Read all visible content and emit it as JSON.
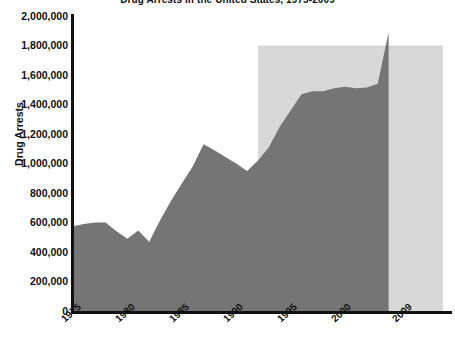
{
  "chart_data": {
    "type": "area",
    "title": "Drug Arrests in the United States, 1975-2009",
    "xlabel": "",
    "ylabel": "Drug Arrests",
    "ylim": [
      0,
      2000000
    ],
    "xlim": [
      1975,
      2009
    ],
    "grid": false,
    "legend": "none",
    "y_ticks": [
      "0",
      "200,000",
      "400,000",
      "600,000",
      "800,000",
      "1,000,000",
      "1,200,000",
      "1,400,000",
      "1,600,000",
      "1,800,000",
      "2,000,000"
    ],
    "y_tick_values": [
      0,
      200000,
      400000,
      600000,
      800000,
      1000000,
      1200000,
      1400000,
      1600000,
      1800000,
      2000000
    ],
    "x_ticks": [
      "1975",
      "1980",
      "1985",
      "1990",
      "1995",
      "2000",
      "2009"
    ],
    "x_tick_values": [
      1975,
      1980,
      1985,
      1990,
      1995,
      2000,
      2009
    ],
    "series": [
      {
        "name": "Drug Arrests",
        "color": "#757575",
        "x": [
          1975,
          1976,
          1977,
          1978,
          1979,
          1980,
          1981,
          1982,
          1983,
          1984,
          1985,
          1986,
          1987,
          1988,
          1989,
          1990,
          1991,
          1992,
          1993,
          1994,
          1995,
          1996,
          1997,
          1998,
          1999,
          2000,
          2001,
          2002,
          2003,
          2004
        ],
        "values": [
          575000,
          590000,
          600000,
          600000,
          540000,
          490000,
          545000,
          470000,
          615000,
          745000,
          865000,
          980000,
          1130000,
          1090000,
          1045000,
          1000000,
          950000,
          1020000,
          1110000,
          1250000,
          1360000,
          1470000,
          1490000,
          1490000,
          1510000,
          1520000,
          1510000,
          1515000,
          1540000,
          1890000
        ]
      }
    ],
    "shaded_region": {
      "label": "",
      "color": "#d8d8d8",
      "x_start": 1992,
      "x_end": 2009,
      "y_top": 1800000,
      "y_bottom": 0
    }
  },
  "axes": {
    "axis_color": "#111111",
    "background": "#ffffff"
  },
  "caption": ""
}
